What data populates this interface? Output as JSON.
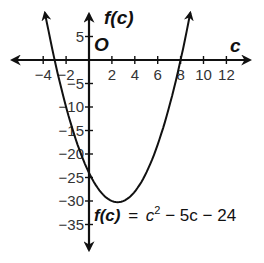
{
  "chart_data": {
    "type": "line",
    "title": "",
    "function": "f(c) = c^2 - 5c - 24",
    "equation_label": {
      "lhs": "f(c)",
      "equals": "=",
      "rhs_c": "c",
      "rhs_exp": "2",
      "rhs_rest": " − 5c − 24"
    },
    "xlabel": "c",
    "ylabel": "f(c)",
    "origin_label": "O",
    "xlim": [
      -5,
      13
    ],
    "ylim": [
      -37,
      10
    ],
    "x_ticks": [
      -4,
      -2,
      2,
      4,
      6,
      8,
      10,
      12
    ],
    "x_tick_labels": [
      "−4",
      "−2",
      "2",
      "4",
      "6",
      "8",
      "10",
      "12"
    ],
    "y_ticks": [
      5,
      -5,
      -10,
      -15,
      -20,
      -25,
      -30,
      -35
    ],
    "y_tick_labels": [
      "5",
      "−5",
      "−10",
      "−15",
      "−20",
      "−25",
      "−30",
      "−35"
    ],
    "grid": false,
    "legend": null,
    "key_points": {
      "roots": [
        -3,
        8
      ],
      "y_intercept": -24,
      "vertex": [
        2.5,
        -30.25
      ]
    },
    "series": [
      {
        "name": "f(c) = c^2 - 5c - 24",
        "x": [
          -4.1,
          -3,
          -2,
          -1,
          0,
          1,
          2,
          2.5,
          3,
          4,
          5,
          6,
          7,
          8,
          9.1
        ],
        "y": [
          -3.7,
          0,
          -10,
          -18,
          -24,
          -28,
          -30,
          -30.25,
          -30,
          -28,
          -24,
          -18,
          -10,
          0,
          12.3
        ]
      }
    ]
  }
}
